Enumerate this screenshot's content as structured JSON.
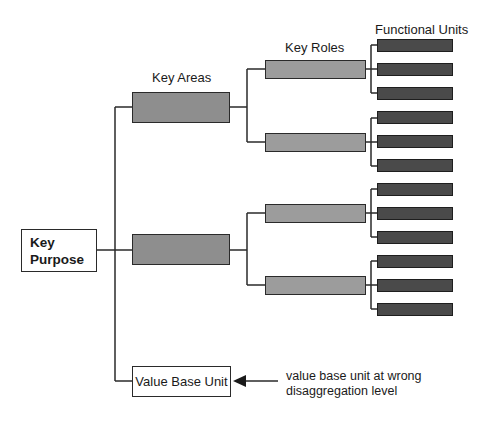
{
  "diagram": {
    "root": {
      "line1": "Key",
      "line2": "Purpose"
    },
    "headers": {
      "key_areas": "Key Areas",
      "key_roles": "Key Roles",
      "functional_units": "Functional Units"
    },
    "key_areas": [
      {
        "id": "area-1",
        "roles": [
          "role-1",
          "role-2"
        ]
      },
      {
        "id": "area-2",
        "roles": [
          "role-3",
          "role-4"
        ]
      }
    ],
    "key_roles_count": 4,
    "functional_units_per_role": 3,
    "functional_units_total": 12,
    "value_base_unit": {
      "label": "Value Base Unit"
    },
    "annotation": {
      "line1": "value base unit at wrong",
      "line2": "disaggregation level"
    },
    "colors": {
      "key_area_fill": "#8e8e8e",
      "key_role_fill": "#9c9c9c",
      "functional_unit_fill": "#4a4a4a",
      "line": "#2a2a2a"
    }
  }
}
